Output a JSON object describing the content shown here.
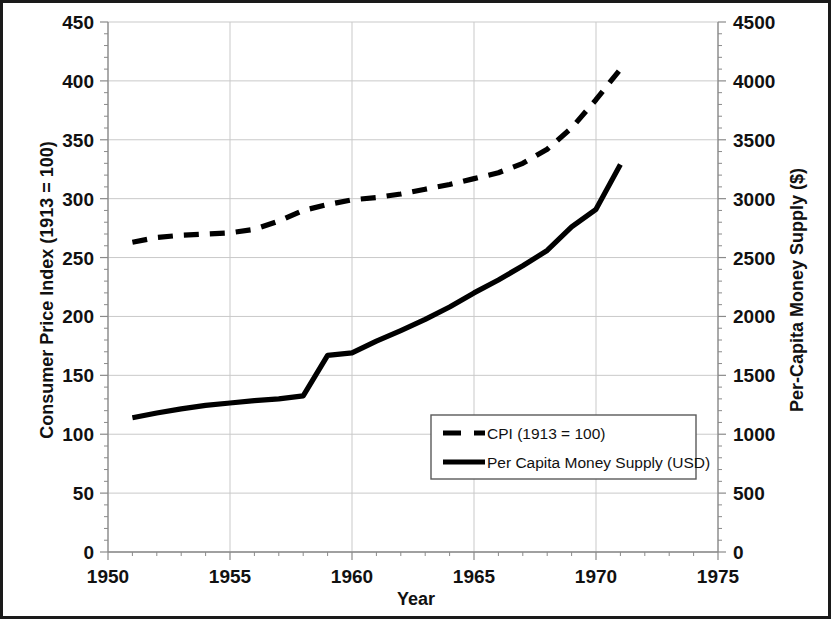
{
  "chart_data": {
    "type": "line",
    "title": "",
    "xlabel": "Year",
    "ylabel": "Consumer Price Index (1913 = 100)",
    "y2label": "Per-Capita Money Supply ($)",
    "xlim": [
      1950,
      1975
    ],
    "ylim": [
      0,
      450
    ],
    "y2lim": [
      0,
      4500
    ],
    "xticks": [
      1950,
      1955,
      1960,
      1965,
      1970,
      1975
    ],
    "xtick_labels": [
      "1950",
      "1955",
      "1960",
      "1965",
      "1970",
      "1975"
    ],
    "yticks": [
      0,
      50,
      100,
      150,
      200,
      250,
      300,
      350,
      400,
      450
    ],
    "ytick_labels": [
      "0",
      "50",
      "100",
      "150",
      "200",
      "250",
      "300",
      "350",
      "400",
      "450"
    ],
    "y2ticks": [
      0,
      500,
      1000,
      1500,
      2000,
      2500,
      3000,
      3500,
      4000,
      4500
    ],
    "y2tick_labels": [
      "0",
      "500",
      "1000",
      "1500",
      "2000",
      "2500",
      "3000",
      "3500",
      "4000",
      "4500"
    ],
    "grid": true,
    "minor_ticks": true,
    "legend_position": "center-right-inside",
    "x": [
      1951,
      1952,
      1953,
      1954,
      1955,
      1956,
      1957,
      1958,
      1959,
      1960,
      1961,
      1962,
      1963,
      1964,
      1965,
      1966,
      1967,
      1968,
      1969,
      1970,
      1971
    ],
    "series": [
      {
        "name": "CPI (1913 = 100)",
        "axis": "left",
        "style": "dashed",
        "color": "#000000",
        "values": [
          263,
          267,
          269,
          270,
          271,
          274,
          281,
          290,
          295,
          299,
          301,
          304,
          308,
          312,
          317,
          322,
          330,
          342,
          360,
          384,
          410
        ]
      },
      {
        "name": "Per Capita Money Supply (USD)",
        "axis": "right",
        "style": "solid",
        "color": "#000000",
        "values": [
          1140,
          1180,
          1215,
          1245,
          1265,
          1285,
          1300,
          1325,
          1670,
          1690,
          1790,
          1880,
          1975,
          2080,
          2200,
          2310,
          2430,
          2560,
          2760,
          2910,
          2950
        ]
      }
    ],
    "series_final_note": [
      {
        "name": "Per Capita Money Supply (USD)",
        "last_x": 1971,
        "last_value": 3290
      }
    ]
  },
  "legend": {
    "entries": [
      {
        "label": "CPI (1913 = 100)",
        "style": "dashed"
      },
      {
        "label": "Per Capita Money Supply (USD)",
        "style": "solid"
      }
    ]
  },
  "axes": {
    "x_title": "Year",
    "y_left_title": "Consumer Price Index (1913 = 100)",
    "y_right_title": "Per-Capita Money Supply ($)"
  },
  "colors": {
    "line": "#000000",
    "grid": "#c9c9c9",
    "axis": "#8a8a8a",
    "border": "#1a1a1a",
    "background": "#ffffff",
    "text": "#111111"
  }
}
